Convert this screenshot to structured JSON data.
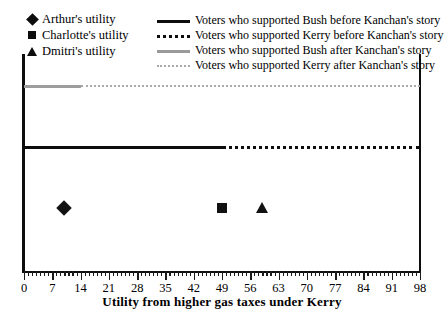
{
  "chart_data": {
    "type": "line",
    "title": "",
    "xlabel": "Utility from higher gas taxes under Kerry",
    "ylabel": "",
    "xlim": [
      0,
      98
    ],
    "xticks": [
      0,
      7,
      14,
      21,
      28,
      35,
      42,
      49,
      56,
      63,
      70,
      77,
      84,
      91,
      98
    ],
    "xtick_labels": [
      "0",
      "7",
      "14",
      "21",
      "28",
      "35",
      "42",
      "49",
      "56",
      "63",
      "70",
      "77",
      "84",
      "91",
      "98"
    ],
    "minor_tick_step": 1,
    "grid": false,
    "legend_position": "top",
    "series": [
      {
        "name": "Voters who supported Bush before Kanchan's story",
        "style": "solid",
        "color": "#0d0d0d",
        "y_level": 0.58,
        "x_start": 0,
        "x_end": 49
      },
      {
        "name": "Voters who supported Kerry before Kanchan's story",
        "style": "dotted",
        "color": "#0d0d0d",
        "y_level": 0.58,
        "x_start": 49,
        "x_end": 98
      },
      {
        "name": "Voters who supported Bush after Kanchan's story",
        "style": "solid",
        "color": "#9d9d9d",
        "y_level": 0.86,
        "x_start": 0,
        "x_end": 14
      },
      {
        "name": "Voters who supported Kerry after Kanchan's story",
        "style": "dotted",
        "color": "#ababab",
        "y_level": 0.86,
        "x_start": 14,
        "x_end": 98
      }
    ],
    "points": [
      {
        "name": "Arthur's utility",
        "marker": "diamond",
        "x": 10,
        "y_level": 0.295
      },
      {
        "name": "Charlotte's utility",
        "marker": "square",
        "x": 49,
        "y_level": 0.295
      },
      {
        "name": "Dmitri's utility",
        "marker": "triangle",
        "x": 59,
        "y_level": 0.295
      }
    ]
  },
  "legend": {
    "markers": [
      {
        "label": "Arthur's utility",
        "icon": "diamond-marker-icon"
      },
      {
        "label": "Charlotte's utility",
        "icon": "square-marker-icon"
      },
      {
        "label": "Dmitri's utility",
        "icon": "triangle-marker-icon"
      }
    ],
    "lines": [
      {
        "label": "Voters who supported Bush before Kanchan's story",
        "icon": "solid-black-line-swatch"
      },
      {
        "label": "Voters who supported Kerry before Kanchan's story",
        "icon": "dotted-black-line-swatch"
      },
      {
        "label": "Voters who supported Bush after Kanchan's story",
        "icon": "solid-gray-line-swatch"
      },
      {
        "label": "Voters who supported Kerry after Kanchan's story",
        "icon": "dotted-gray-line-swatch"
      }
    ]
  },
  "axis": {
    "xlabel": "Utility from higher gas taxes under Kerry"
  },
  "colors": {
    "ink": "#0d0d0d",
    "gray_series": "#9d9d9d",
    "gray_series_light": "#ababab",
    "background": "#ffffff"
  }
}
